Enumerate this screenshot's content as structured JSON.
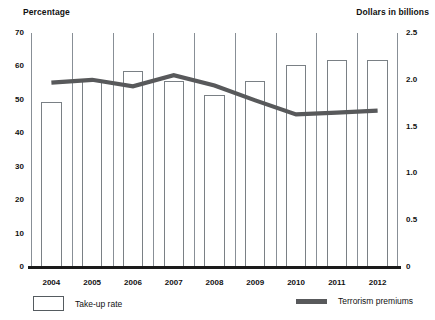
{
  "chart_data": {
    "type": "bar",
    "title": "",
    "categories": [
      "2004",
      "2005",
      "2006",
      "2007",
      "2008",
      "2009",
      "2010",
      "2011",
      "2012"
    ],
    "xlabel": "",
    "ylabel": "Percentage",
    "y2label": "Dollars in billions",
    "ylim": [
      0,
      70
    ],
    "y2lim": [
      0,
      2.5
    ],
    "yticks": [
      "0",
      "10",
      "20",
      "30",
      "40",
      "50",
      "60",
      "70"
    ],
    "y2ticks": [
      "0",
      "0.5",
      "1.0",
      "1.5",
      "2.0",
      "2.5"
    ],
    "grid": "vertical",
    "legend_position": "bottom",
    "series": [
      {
        "name": "Take-up rate",
        "type": "bar",
        "axis": "left",
        "unit": "percent",
        "color": "#ffffff",
        "edge_color": "#7a8085",
        "values": [
          49.5,
          56.0,
          58.5,
          55.5,
          51.5,
          55.5,
          60.5,
          62.0,
          62.0
        ]
      },
      {
        "name": "Terrorism premiums",
        "type": "line",
        "axis": "right",
        "unit": "dollars in billions",
        "color": "#58595b",
        "values": [
          1.97,
          2.0,
          1.93,
          2.05,
          1.94,
          1.78,
          1.63,
          1.65,
          1.67
        ]
      }
    ]
  },
  "axes": {
    "left_title": "Percentage",
    "right_title": "Dollars in billions",
    "left_ticks": [
      "70",
      "60",
      "50",
      "40",
      "30",
      "20",
      "10",
      "0"
    ],
    "right_ticks": [
      "2.5",
      "2.0",
      "1.5",
      "1.0",
      "0.5",
      "0"
    ],
    "x_ticks": [
      "2004",
      "2005",
      "2006",
      "2007",
      "2008",
      "2009",
      "2010",
      "2011",
      "2012"
    ]
  },
  "legend": {
    "bar_label": "Take-up rate",
    "line_label": "Terrorism premiums"
  },
  "colors": {
    "line": "#58595b",
    "bar_edge": "#7a8085",
    "axis": "#1a1a1a",
    "grid": "#888f96"
  }
}
